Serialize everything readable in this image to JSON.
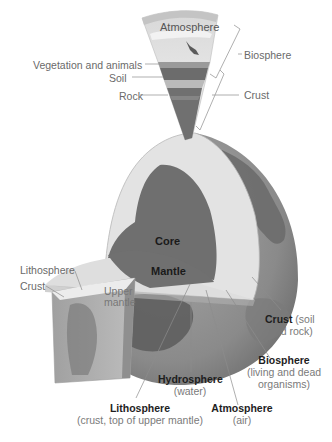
{
  "colors": {
    "background": "#ffffff",
    "core": "#6e6e6e",
    "mantle": "#e2e2e2",
    "globe_surface": "#8a8a8a",
    "globe_land": "#6a6a6a",
    "leader_line": "#8c8c8c",
    "text_label": "#6a6a6a",
    "text_bold": "#1e1e1e"
  },
  "wedge_labels": {
    "atmosphere": "Atmosphere",
    "vegetation": "Vegetation and animals",
    "soil": "Soil",
    "rock": "Rock",
    "biosphere": "Biosphere",
    "crust": "Crust"
  },
  "globe_labels": {
    "core": "Core",
    "mantle": "Mantle",
    "upper_mantle_line1": "Upper",
    "upper_mantle_line2": "mantle",
    "lithosphere_left": "Lithosphere",
    "crust_left": "Crust"
  },
  "bottom_labels": {
    "crust": {
      "title": "Crust",
      "desc_inline": "(soil",
      "desc2": "and rock)"
    },
    "biosphere": {
      "title": "Biosphere",
      "desc1": "(living and dead",
      "desc2": "organisms)"
    },
    "hydrosphere": {
      "title": "Hydrosphere",
      "desc": "(water)"
    },
    "atmosphere": {
      "title": "Atmosphere",
      "desc": "(air)"
    },
    "lithosphere": {
      "title": "Lithosphere",
      "desc": "(crust, top of upper mantle)"
    }
  }
}
